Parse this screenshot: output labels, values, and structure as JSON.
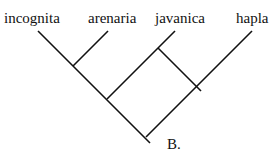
{
  "diagram": {
    "type": "phylogenetic-tree",
    "panel_label": "B.",
    "taxa": [
      {
        "name": "incognita"
      },
      {
        "name": "arenaria"
      },
      {
        "name": "javanica"
      },
      {
        "name": "hapla"
      }
    ],
    "line_color": "#111111"
  }
}
